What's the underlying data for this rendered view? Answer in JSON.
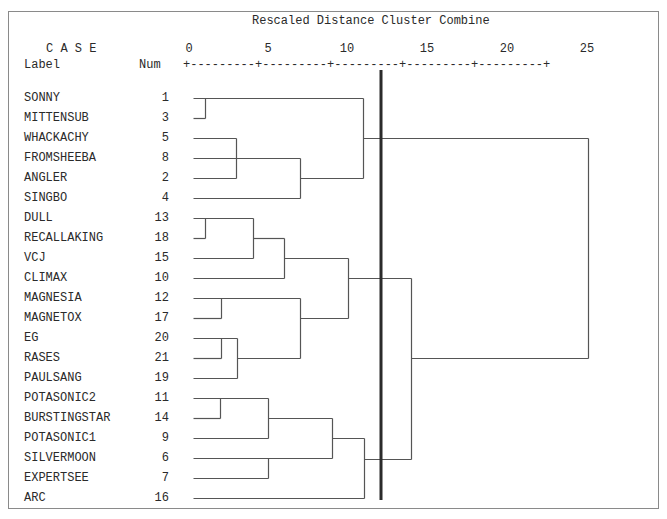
{
  "header": {
    "title": "Rescaled Distance Cluster Combine",
    "case_label": "C A S E",
    "label_col": "Label",
    "num_col": "Num",
    "scale_string": "+---------+---------+---------+---------+---------+"
  },
  "colors": {
    "line": "#555555",
    "cut_line": "#2b2b2b",
    "text": "#2a2a2a",
    "frame": "#8a8a8a"
  },
  "chart_data": {
    "type": "dendrogram",
    "title": "Rescaled Distance Cluster Combine",
    "xlabel": "Rescaled Distance",
    "ylabel": "CASE",
    "x_ticks": [
      0,
      5,
      10,
      15,
      20,
      25
    ],
    "xlim": [
      0,
      25
    ],
    "cut_line_distance": 12.2,
    "leaves": [
      {
        "label": "SONNY",
        "num": "1"
      },
      {
        "label": "MITTENSUB",
        "num": "3"
      },
      {
        "label": "WHACKACHY",
        "num": "5"
      },
      {
        "label": "FROMSHEEBA",
        "num": "8"
      },
      {
        "label": "ANGLER",
        "num": "2"
      },
      {
        "label": "SINGBO",
        "num": "4"
      },
      {
        "label": "DULL",
        "num": "13"
      },
      {
        "label": "RECALLAKING",
        "num": "18"
      },
      {
        "label": "VCJ",
        "num": "15"
      },
      {
        "label": "CLIMAX",
        "num": "10"
      },
      {
        "label": "MAGNESIA",
        "num": "12"
      },
      {
        "label": "MAGNETOX",
        "num": "17"
      },
      {
        "label": "EG",
        "num": "20"
      },
      {
        "label": "RASES",
        "num": "21"
      },
      {
        "label": "PAULSANG",
        "num": "19"
      },
      {
        "label": "POTASONIC2",
        "num": "11"
      },
      {
        "label": "BURSTINGSTAR",
        "num": "14"
      },
      {
        "label": "POTASONIC1",
        "num": "9"
      },
      {
        "label": "SILVERMOON",
        "num": "6"
      },
      {
        "label": "EXPERTSEE",
        "num": "7"
      },
      {
        "label": "ARC",
        "num": "16"
      }
    ],
    "merges": [
      {
        "members": [
          "SONNY",
          "MITTENSUB"
        ],
        "distance": 0.8
      },
      {
        "members": [
          "WHACKACHY",
          "ANGLER"
        ],
        "distance": 3.0
      },
      {
        "members": [
          "WHACKACHY+ANGLER",
          "FROMSHEEBA",
          "SINGBO"
        ],
        "distance": 6.9
      },
      {
        "members": [
          "SONNY+MITTENSUB",
          "WHACKACHY+FROMSHEEBA+ANGLER+SINGBO"
        ],
        "distance": 10.9
      },
      {
        "members": [
          "DULL",
          "RECALLAKING"
        ],
        "distance": 0.8
      },
      {
        "members": [
          "DULL+RECALLAKING",
          "VCJ"
        ],
        "distance": 3.9
      },
      {
        "members": [
          "DULL+RECALLAKING+VCJ",
          "CLIMAX"
        ],
        "distance": 5.9
      },
      {
        "members": [
          "MAGNESIA",
          "MAGNETOX"
        ],
        "distance": 1.8
      },
      {
        "members": [
          "EG",
          "RASES"
        ],
        "distance": 1.8
      },
      {
        "members": [
          "EG+RASES",
          "PAULSANG"
        ],
        "distance": 2.9
      },
      {
        "members": [
          "MAGNESIA+MAGNETOX",
          "EG+RASES+PAULSANG"
        ],
        "distance": 6.9
      },
      {
        "members": [
          "DULL..CLIMAX",
          "MAGNESIA..PAULSANG"
        ],
        "distance": 9.9
      },
      {
        "members": [
          "POTASONIC2",
          "BURSTINGSTAR"
        ],
        "distance": 1.8
      },
      {
        "members": [
          "POTASONIC2+BURSTINGSTAR",
          "POTASONIC1"
        ],
        "distance": 4.9
      },
      {
        "members": [
          "SILVERMOON",
          "EXPERTSEE"
        ],
        "distance": 4.9
      },
      {
        "members": [
          "POTASONIC2+BURSTINGSTAR+POTASONIC1",
          "SILVERMOON+EXPERTSEE"
        ],
        "distance": 8.9
      },
      {
        "members": [
          "POTASONIC..EXPERTSEE",
          "ARC"
        ],
        "distance": 10.9
      },
      {
        "members": [
          "DULL..PAULSANG",
          "POTASONIC..ARC"
        ],
        "distance": 13.9
      },
      {
        "members": [
          "SONNY..SINGBO",
          "DULL..ARC"
        ],
        "distance": 25.0
      }
    ]
  },
  "geometry": {
    "row_y": [
      98,
      118,
      138,
      158,
      178,
      198,
      218,
      238,
      258,
      278,
      298,
      318,
      338,
      358,
      378,
      398,
      418,
      438,
      458,
      478,
      498
    ],
    "tick_x": [
      189,
      268,
      347,
      427,
      507,
      587
    ],
    "cut_x": 381,
    "cut_y": [
      70,
      500
    ],
    "segments": [
      [
        193,
        98,
        363,
        98
      ],
      [
        193,
        118,
        205,
        118
      ],
      [
        205,
        98,
        205,
        118
      ],
      [
        193,
        138,
        236,
        138
      ],
      [
        193,
        178,
        236,
        178
      ],
      [
        236,
        138,
        236,
        178
      ],
      [
        193,
        158,
        300,
        158
      ],
      [
        193,
        198,
        300,
        198
      ],
      [
        300,
        158,
        300,
        198
      ],
      [
        236,
        158,
        236,
        158
      ],
      [
        300,
        178,
        363,
        178
      ],
      [
        363,
        98,
        363,
        178
      ],
      [
        363,
        138,
        588,
        138
      ],
      [
        193,
        218,
        253,
        218
      ],
      [
        193,
        238,
        205,
        238
      ],
      [
        205,
        218,
        205,
        238
      ],
      [
        193,
        258,
        253,
        258
      ],
      [
        253,
        218,
        253,
        258
      ],
      [
        253,
        238,
        284,
        238
      ],
      [
        193,
        278,
        284,
        278
      ],
      [
        284,
        238,
        284,
        278
      ],
      [
        284,
        258,
        348,
        258
      ],
      [
        193,
        298,
        300,
        298
      ],
      [
        193,
        318,
        221,
        318
      ],
      [
        221,
        298,
        221,
        318
      ],
      [
        193,
        338,
        237,
        338
      ],
      [
        193,
        358,
        221,
        358
      ],
      [
        221,
        338,
        221,
        358
      ],
      [
        193,
        378,
        237,
        378
      ],
      [
        237,
        338,
        237,
        378
      ],
      [
        237,
        358,
        300,
        358
      ],
      [
        300,
        298,
        300,
        358
      ],
      [
        300,
        318,
        348,
        318
      ],
      [
        348,
        258,
        348,
        318
      ],
      [
        348,
        278,
        411,
        278
      ],
      [
        193,
        398,
        268,
        398
      ],
      [
        193,
        418,
        220,
        418
      ],
      [
        220,
        398,
        220,
        418
      ],
      [
        193,
        438,
        268,
        438
      ],
      [
        268,
        398,
        268,
        438
      ],
      [
        268,
        418,
        332,
        418
      ],
      [
        193,
        458,
        332,
        458
      ],
      [
        193,
        478,
        268,
        478
      ],
      [
        268,
        458,
        268,
        478
      ],
      [
        332,
        418,
        332,
        458
      ],
      [
        332,
        438,
        364,
        438
      ],
      [
        193,
        498,
        364,
        498
      ],
      [
        364,
        438,
        364,
        498
      ],
      [
        364,
        459,
        411,
        459
      ],
      [
        411,
        278,
        411,
        459
      ],
      [
        411,
        358,
        588,
        358
      ],
      [
        588,
        138,
        588,
        358
      ]
    ]
  }
}
